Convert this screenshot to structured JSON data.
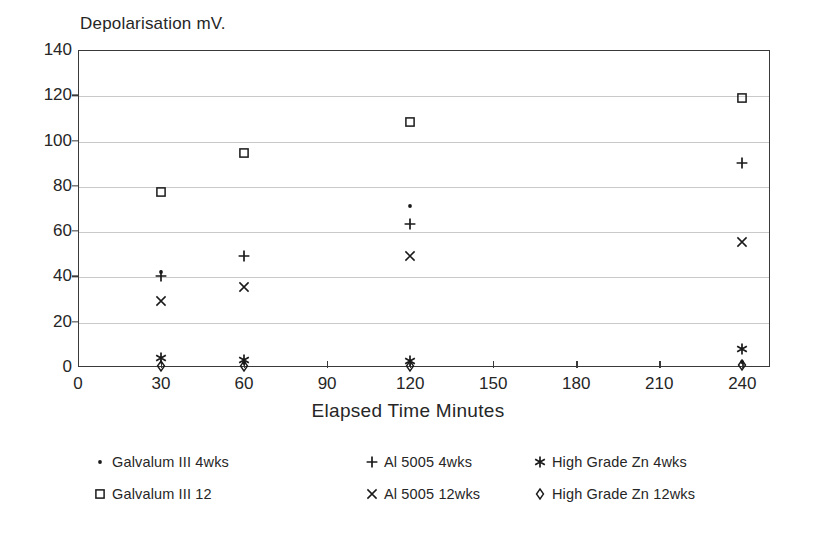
{
  "chart_data": {
    "type": "scatter",
    "title": "Depolarisation mV.",
    "xlabel": "Elapsed Time Minutes",
    "ylabel": "Depolarisation mV.",
    "xlim": [
      0,
      250
    ],
    "ylim": [
      0,
      140
    ],
    "grid": "horizontal",
    "legend_position": "below-axes",
    "xticks": [
      0,
      30,
      60,
      90,
      120,
      150,
      180,
      210,
      240
    ],
    "xtick_labels": [
      "0",
      "30",
      "60",
      "90",
      "120",
      "150",
      "180",
      "210",
      "240"
    ],
    "yticks": [
      0,
      20,
      40,
      60,
      80,
      100,
      120,
      140
    ],
    "ytick_labels": [
      "0",
      "20",
      "40",
      "60",
      "80",
      "100",
      "120",
      "140"
    ],
    "x": [
      30,
      60,
      120,
      240
    ],
    "series": [
      {
        "name": "Galvalum III 4wks",
        "marker": "dot",
        "color": "#1a1a1a",
        "values": [
          42,
          2,
          71,
          2
        ]
      },
      {
        "name": "Galvalum III 12",
        "marker": "open-square",
        "color": "#1a1a1a",
        "values": [
          77.5,
          94.5,
          108,
          119
        ]
      },
      {
        "name": "Al 5005 4wks",
        "marker": "plus",
        "color": "#1a1a1a",
        "values": [
          40,
          49,
          63,
          90
        ]
      },
      {
        "name": "Al 5005 12wks",
        "marker": "cross",
        "color": "#1a1a1a",
        "values": [
          29,
          35.5,
          49,
          55
        ]
      },
      {
        "name": "High Grade Zn 4wks",
        "marker": "asterisk",
        "color": "#1a1a1a",
        "values": [
          4,
          3,
          2.5,
          8
        ]
      },
      {
        "name": "High Grade Zn 12wks",
        "marker": "open-diamond",
        "color": "#1a1a1a",
        "values": [
          0.5,
          0.5,
          0.5,
          1
        ]
      }
    ]
  },
  "legend": [
    {
      "label": "Galvalum III 4wks",
      "marker": "dot",
      "col": 0,
      "row": 0
    },
    {
      "label": "Galvalum III 12",
      "marker": "open-square",
      "col": 0,
      "row": 1
    },
    {
      "label": "Al 5005 4wks",
      "marker": "plus",
      "col": 1,
      "row": 0
    },
    {
      "label": "Al 5005 12wks",
      "marker": "cross",
      "col": 1,
      "row": 1
    },
    {
      "label": "High Grade Zn 4wks",
      "marker": "asterisk",
      "col": 2,
      "row": 0
    },
    {
      "label": "High Grade Zn 12wks",
      "marker": "open-diamond",
      "col": 2,
      "row": 1
    }
  ]
}
